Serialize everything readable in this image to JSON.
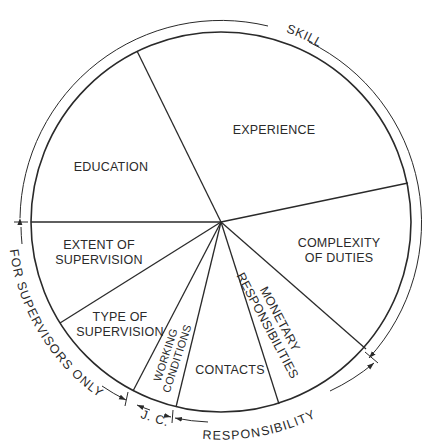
{
  "diagram": {
    "type": "pie-diagram",
    "center": [
      221,
      222
    ],
    "inner_radius": 190,
    "outer_radius": 201,
    "colors": {
      "line": "#2a2a2a",
      "background": "#ffffff"
    },
    "slices": [
      {
        "id": "education",
        "lines": [
          "EDUCATION"
        ],
        "group": "skill"
      },
      {
        "id": "experience",
        "lines": [
          "EXPERIENCE"
        ],
        "group": "skill"
      },
      {
        "id": "complexity",
        "lines": [
          "COMPLEXITY",
          "OF  DUTIES"
        ],
        "group": "skill"
      },
      {
        "id": "monetary",
        "lines": [
          "MONETARY",
          "RESPONSIBILITIES"
        ],
        "group": "responsibility"
      },
      {
        "id": "contacts",
        "lines": [
          "CONTACTS"
        ],
        "group": "responsibility"
      },
      {
        "id": "working",
        "lines": [
          "WORKING",
          "CONDITIONS"
        ],
        "group": "jc"
      },
      {
        "id": "type",
        "lines": [
          "TYPE  OF",
          "SUPERVISION"
        ],
        "group": "supervisors"
      },
      {
        "id": "extent",
        "lines": [
          "EXTENT  OF",
          "SUPERVISION"
        ],
        "group": "supervisors"
      }
    ],
    "groups": {
      "skill": "SKILL",
      "responsibility": "RESPONSIBILITY",
      "jc": "J. C.",
      "supervisors": "FOR SUPERVISORS ONLY"
    }
  }
}
